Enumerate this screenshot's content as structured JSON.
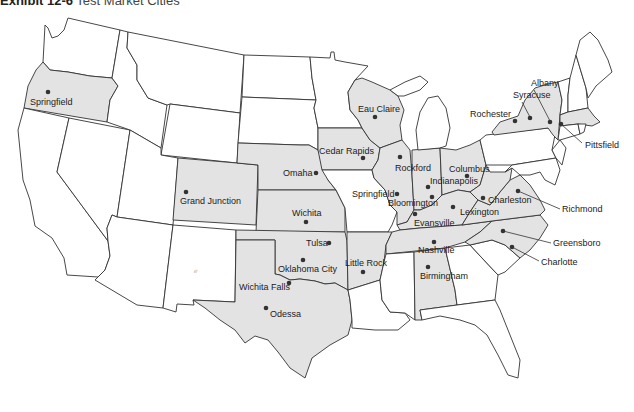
{
  "title": {
    "exhibit": "Exhibit 12-6",
    "text": "Test Market Cities"
  },
  "colors": {
    "shaded_state": "#e3e3e3",
    "unshaded_state": "#ffffff",
    "border": "#333333",
    "city_dot": "#333333"
  },
  "shaded_states": [
    "Oregon",
    "Colorado",
    "Nebraska",
    "Kansas",
    "Oklahoma",
    "Texas",
    "Iowa",
    "Wisconsin",
    "Illinois",
    "Indiana",
    "Ohio",
    "Kentucky",
    "Tennessee",
    "Arkansas",
    "Alabama",
    "West Virginia",
    "Virginia",
    "North Carolina",
    "New York",
    "Massachusetts"
  ],
  "cities": [
    {
      "name": "Springfield",
      "state": "OR",
      "x": 48,
      "y": 92,
      "lx": 30,
      "ly": 105
    },
    {
      "name": "Grand Junction",
      "state": "CO",
      "x": 186,
      "y": 192,
      "lx": 180,
      "ly": 204
    },
    {
      "name": "Omaha",
      "state": "NE",
      "x": 316,
      "y": 173,
      "lx": 283,
      "ly": 176
    },
    {
      "name": "Wichita",
      "state": "KS",
      "x": 306,
      "y": 222,
      "lx": 292,
      "ly": 216
    },
    {
      "name": "Tulsa",
      "state": "OK",
      "x": 329,
      "y": 243,
      "lx": 306,
      "ly": 246
    },
    {
      "name": "Oklahoma City",
      "state": "OK",
      "x": 303,
      "y": 260,
      "lx": 278,
      "ly": 272
    },
    {
      "name": "Wichita Falls",
      "state": "TX",
      "x": 289,
      "y": 283,
      "lx": 239,
      "ly": 290
    },
    {
      "name": "Odessa",
      "state": "TX",
      "x": 266,
      "y": 308,
      "lx": 270,
      "ly": 317
    },
    {
      "name": "Little Rock",
      "state": "AR",
      "x": 363,
      "y": 272,
      "lx": 345,
      "ly": 266
    },
    {
      "name": "Cedar Rapids",
      "state": "IA",
      "x": 363,
      "y": 158,
      "lx": 319,
      "ly": 154
    },
    {
      "name": "Eau Claire",
      "state": "WI",
      "x": 375,
      "y": 117,
      "lx": 358,
      "ly": 112
    },
    {
      "name": "Rockford",
      "state": "IL",
      "x": 400,
      "y": 157,
      "lx": 395,
      "ly": 171
    },
    {
      "name": "Springfield",
      "state": "IL",
      "x": 397,
      "y": 194,
      "lx": 352,
      "ly": 197
    },
    {
      "name": "Bloomington",
      "state": "IL",
      "x": 432,
      "y": 197,
      "lx": 388,
      "ly": 206
    },
    {
      "name": "Indianapolis",
      "state": "IN",
      "x": 428,
      "y": 187,
      "lx": 430,
      "ly": 184
    },
    {
      "name": "Columbus",
      "state": "OH",
      "x": 467,
      "y": 176,
      "lx": 449,
      "ly": 172
    },
    {
      "name": "Evansville",
      "state": "IN",
      "x": 415,
      "y": 214,
      "lx": 414,
      "ly": 226
    },
    {
      "name": "Lexington",
      "state": "KY",
      "x": 453,
      "y": 207,
      "lx": 460,
      "ly": 215
    },
    {
      "name": "Charleston",
      "state": "WV",
      "x": 483,
      "y": 198,
      "lx": 488,
      "ly": 203
    },
    {
      "name": "Richmond",
      "state": "VA",
      "x": 518,
      "y": 191,
      "lx": 562,
      "ly": 212
    },
    {
      "name": "Nashville",
      "state": "TN",
      "x": 434,
      "y": 242,
      "lx": 418,
      "ly": 253
    },
    {
      "name": "Greensboro",
      "state": "NC",
      "x": 503,
      "y": 231,
      "lx": 553,
      "ly": 246
    },
    {
      "name": "Charlotte",
      "state": "NC",
      "x": 512,
      "y": 247,
      "lx": 541,
      "ly": 265
    },
    {
      "name": "Birmingham",
      "state": "AL",
      "x": 428,
      "y": 267,
      "lx": 420,
      "ly": 279
    },
    {
      "name": "Rochester",
      "state": "NY",
      "x": 515,
      "y": 121,
      "lx": 470,
      "ly": 117
    },
    {
      "name": "Syracuse",
      "state": "NY",
      "x": 530,
      "y": 118,
      "lx": 513,
      "ly": 98
    },
    {
      "name": "Albany",
      "state": "NY",
      "x": 550,
      "y": 122,
      "lx": 531,
      "ly": 86
    },
    {
      "name": "Pittsfield",
      "state": "MA",
      "x": 561,
      "y": 124,
      "lx": 585,
      "ly": 148
    }
  ]
}
